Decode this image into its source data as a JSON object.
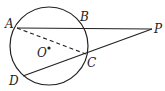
{
  "diagram": {
    "type": "geometry",
    "circle": {
      "center_label": "O",
      "cx": 49,
      "cy": 46,
      "r": 39
    },
    "points": {
      "A": {
        "label": "A",
        "x": 17,
        "y": 28
      },
      "B": {
        "label": "B",
        "x": 82,
        "y": 28
      },
      "C": {
        "label": "C",
        "x": 86,
        "y": 54
      },
      "D": {
        "label": "D",
        "x": 23,
        "y": 76
      },
      "P": {
        "label": "P",
        "x": 152,
        "y": 29
      },
      "O": {
        "label": "O",
        "x": 49,
        "y": 48
      }
    },
    "segments": [
      {
        "from": "A",
        "to": "P",
        "style": "solid"
      },
      {
        "from": "D",
        "to": "P",
        "style": "solid"
      },
      {
        "from": "A",
        "to": "C",
        "style": "dashed"
      }
    ],
    "color": "#222222"
  }
}
